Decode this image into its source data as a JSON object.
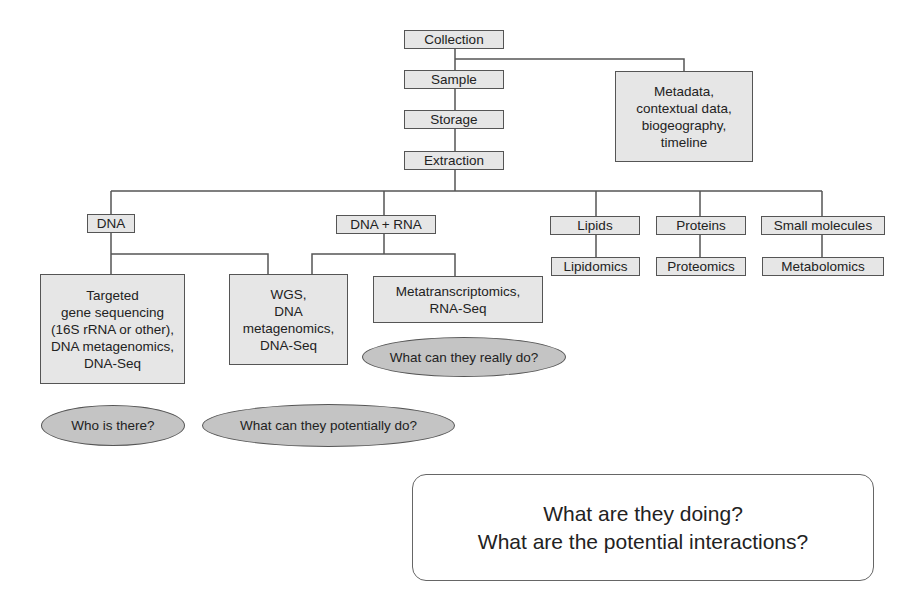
{
  "diagram": {
    "pipeline": {
      "collection": "Collection",
      "sample": "Sample",
      "storage": "Storage",
      "extraction": "Extraction"
    },
    "metadata": "Metadata,\ncontextual data,\nbiogeography,\ntimeline",
    "branches": {
      "dna": "DNA",
      "dna_rna": "DNA + RNA",
      "lipids": "Lipids",
      "proteins": "Proteins",
      "small_molecules": "Small molecules"
    },
    "methods": {
      "targeted": "Targeted\ngene sequencing\n(16S rRNA or other),\nDNA metagenomics,\nDNA-Seq",
      "wgs": "WGS,\nDNA\nmetagenomics,\nDNA-Seq",
      "metatranscriptomics": "Metatranscriptomics,\nRNA-Seq",
      "lipidomics": "Lipidomics",
      "proteomics": "Proteomics",
      "metabolomics": "Metabolomics"
    },
    "questions": {
      "who": "Who is there?",
      "potential": "What can they potentially do?",
      "really": "What can they really do?"
    },
    "summary": {
      "line1": "What are they doing?",
      "line2": "What are the potential interactions?"
    }
  }
}
